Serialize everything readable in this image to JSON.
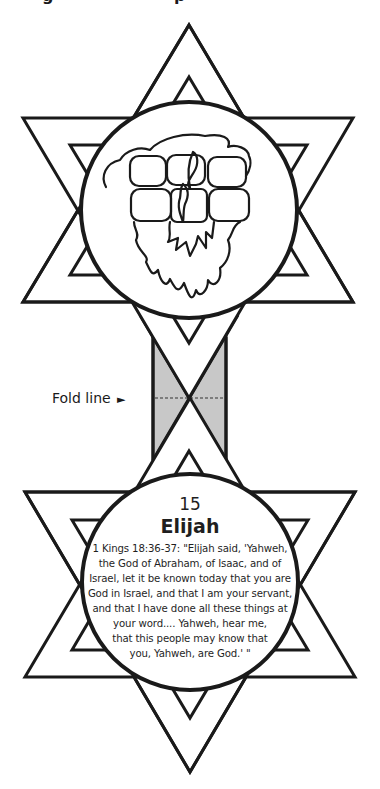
{
  "page": {
    "cropped_heading_fragments": [
      "g",
      "p"
    ]
  },
  "top_card": {
    "illustration": "altar-of-stones-with-fire-icon",
    "description": "Stone altar with flames and smoke cloud"
  },
  "fold": {
    "label": "Fold line",
    "arrow": "►",
    "fill_color": "#c8c8c8",
    "line_style": "dashed"
  },
  "bottom_card": {
    "number": "15",
    "title": "Elijah",
    "quote_lines": [
      "1 Kings 18:36-37: \"Elijah said, 'Yahweh,",
      "the God of Abraham, of Isaac, and of",
      "Israel, let it be known today that you are",
      "God in Israel, and that I am your servant,",
      "and that I have done all these things at",
      "your word.... Yahweh, hear me,",
      "that this people may know that",
      "you, Yahweh, are God.' \""
    ]
  },
  "colors": {
    "stroke": "#1a1a1a",
    "background": "#ffffff",
    "strip_gray": "#c8c8c8"
  }
}
